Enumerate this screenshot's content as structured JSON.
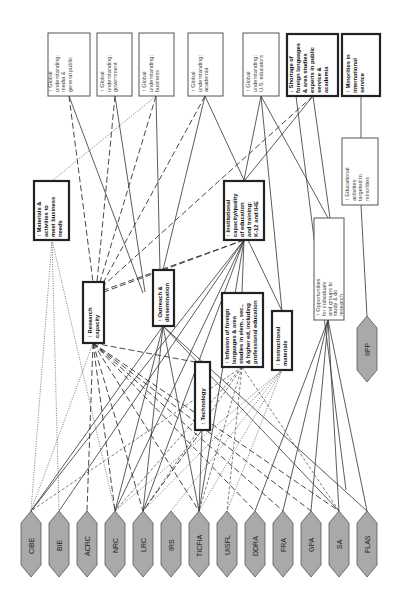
{
  "diagram": {
    "orientation": "rotated 90 degrees counter-clockwise",
    "outcomes": [
      {
        "id": "gu_media",
        "label": "↑ Global understanding: media & general public",
        "lines": [
          "↑ Global",
          "understanding:",
          "media &",
          "general public"
        ],
        "emphasis": "normal"
      },
      {
        "id": "gu_gov",
        "label": "↑ Global understanding: government",
        "lines": [
          "↑ Global",
          "understanding:",
          "government"
        ],
        "emphasis": "normal"
      },
      {
        "id": "gu_bus",
        "label": "↑ Global understanding: business",
        "lines": [
          "↑ Global",
          "understanding:",
          "business"
        ],
        "emphasis": "normal"
      },
      {
        "id": "gu_acad",
        "label": "↑ Global understanding: academia",
        "lines": [
          "↑ Global",
          "understanding:",
          "academia"
        ],
        "emphasis": "normal"
      },
      {
        "id": "gu_useduc",
        "label": "↑ Global understanding: U.S. educators",
        "lines": [
          "↑ Global",
          "understanding:",
          "U.S. educators"
        ],
        "emphasis": "normal"
      },
      {
        "id": "shortage",
        "label": "↓ Shortage of foreign languages & area studies experts in public service & academia",
        "lines": [
          "↓ Shortage of",
          "foreign languages",
          "& area studies",
          "experts in public",
          "service &",
          "academia"
        ],
        "emphasis": "bold"
      },
      {
        "id": "minorities",
        "label": "↑ Minorities in international service",
        "lines": [
          "↑ Minorities in",
          "international",
          "service"
        ],
        "emphasis": "bold"
      }
    ],
    "intermediate": [
      {
        "id": "materials",
        "label": "↑ Materials & activities to meet business needs",
        "lines": [
          "↑ Materials &",
          "activities to",
          "meet business",
          "needs"
        ],
        "emphasis": "bold"
      },
      {
        "id": "research",
        "label": "↑ Research capacity",
        "lines": [
          "↑ Research",
          "capacity"
        ],
        "emphasis": "bold"
      },
      {
        "id": "outreach",
        "label": "↑ Outreach & dissemination",
        "lines": [
          "↑ Outreach &",
          "dissemination"
        ],
        "emphasis": "bold"
      },
      {
        "id": "institutional",
        "label": "↑ Institutional capacity/quality of education and training: K-12 and IHE",
        "lines": [
          "↑ Institutional",
          "capacity/quality",
          "of education",
          "and training:",
          "K-12 and IHE"
        ],
        "emphasis": "bold"
      },
      {
        "id": "infusion",
        "label": "↑ Infusion of foreign languages & area studies in elem., sec., & higher ed, including professional education",
        "lines": [
          "↑ Infusion of foreign",
          "languages & area",
          "studies in elem., sec.,",
          "& higher ed, including",
          "professional education"
        ],
        "emphasis": "bold"
      },
      {
        "id": "instructional",
        "label": "↑ Instructional materials",
        "lines": [
          "↑ Instructional",
          "materials"
        ],
        "emphasis": "bold"
      },
      {
        "id": "technology",
        "label": "↑ Technology",
        "lines": [
          "↑ Technology"
        ],
        "emphasis": "bold"
      },
      {
        "id": "educ_activities",
        "label": "↑ Educational activities targeted to minorities",
        "lines": [
          "↑ Educational",
          "activities",
          "targeted to",
          "minorities"
        ],
        "emphasis": "normal"
      },
      {
        "id": "opportunities",
        "label": "↑ Opportunities for individuals and groups to study & do research",
        "lines": [
          "↑ Opportunities",
          "for individuals",
          "and groups to",
          "study & do",
          "research"
        ],
        "emphasis": "normal"
      }
    ],
    "programs": [
      {
        "id": "CIBE",
        "label": "CIBE"
      },
      {
        "id": "BIE",
        "label": "BIE"
      },
      {
        "id": "ACRC",
        "label": "ACRC"
      },
      {
        "id": "NRC",
        "label": "NRC"
      },
      {
        "id": "LRC",
        "label": "LRC"
      },
      {
        "id": "IRS",
        "label": "IRS"
      },
      {
        "id": "TICFIA",
        "label": "TICFIA"
      },
      {
        "id": "UISFL",
        "label": "UISFL"
      },
      {
        "id": "DDRA",
        "label": "DDRA"
      },
      {
        "id": "FRA",
        "label": "FRA"
      },
      {
        "id": "GPA",
        "label": "GPA"
      },
      {
        "id": "SA",
        "label": "SA"
      },
      {
        "id": "FLAS",
        "label": "FLAS"
      },
      {
        "id": "IIPP",
        "label": "IIPP"
      }
    ],
    "line_styles": [
      "solid",
      "long-dash",
      "short-dash",
      "dotted"
    ],
    "colors": {
      "hexagon_fill": "#a9a9a9",
      "line": "#333333",
      "box_border": "#222222",
      "background": "#ffffff"
    }
  }
}
